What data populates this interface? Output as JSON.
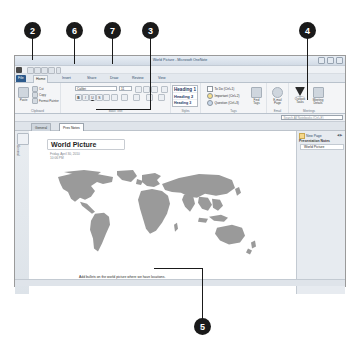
{
  "window": {
    "title": "World Picture - Microsoft OneNote",
    "controls": [
      "minimize",
      "restore",
      "close"
    ]
  },
  "quick_access": {
    "buttons": [
      "save-icon",
      "undo-icon",
      "dock-icon",
      "full-page-icon",
      "print-icon",
      "customize-icon"
    ]
  },
  "ribbon": {
    "file_tab": "File",
    "tabs": [
      {
        "label": "Home",
        "active": true
      },
      {
        "label": "Insert",
        "active": false
      },
      {
        "label": "Share",
        "active": false
      },
      {
        "label": "Draw",
        "active": false
      },
      {
        "label": "Review",
        "active": false
      },
      {
        "label": "View",
        "active": false
      }
    ],
    "groups": [
      {
        "name": "Clipboard",
        "label": "Clipboard",
        "paste_label": "Paste",
        "items": [
          "Cut",
          "Copy",
          "Format Painter"
        ]
      },
      {
        "name": "Basic Text",
        "label": "Basic Text",
        "font_name": "Calibri",
        "font_size": "11",
        "buttons": [
          "B",
          "I",
          "U",
          "abc",
          "A",
          "highlight",
          "font-color",
          "bullets",
          "numbering",
          "indent",
          "align",
          "styles"
        ]
      },
      {
        "name": "Styles",
        "label": "Styles",
        "styles": [
          "Heading 1",
          "Heading 2",
          "Heading 3"
        ]
      },
      {
        "name": "Tags",
        "label": "Tags",
        "tags": [
          "To Do (Ctrl+1)",
          "Important (Ctrl+2)",
          "Question (Ctrl+3)"
        ],
        "find_tags_label": "Find Tags"
      },
      {
        "name": "Email",
        "label": "Email",
        "email_page_label": "E-mail Page"
      },
      {
        "name": "Meetings",
        "label": "Meetings",
        "outlook_tasks_label": "Outlook Tasks",
        "meeting_details_label": "Meeting Details"
      }
    ]
  },
  "search": {
    "placeholder": "Search All Notebooks (Ctrl+E)"
  },
  "section_tabs": [
    {
      "label": "General",
      "active": false
    },
    {
      "label": "Pres Notes",
      "active": true
    }
  ],
  "navigation": {
    "notebook_label": "General"
  },
  "page": {
    "title": "World Picture",
    "date": "Friday, April 30, 2010",
    "time": "10:06 PM",
    "caption": "Add bullets on the world picture where we have locations."
  },
  "right_pane": {
    "new_page_label": "New Page",
    "section_header": "Presentation Notes",
    "pages": [
      "World Picture"
    ]
  },
  "callouts": [
    {
      "number": "2",
      "x": 24,
      "y": 22
    },
    {
      "number": "6",
      "x": 66,
      "y": 22
    },
    {
      "number": "7",
      "x": 104,
      "y": 22
    },
    {
      "number": "3",
      "x": 142,
      "y": 22
    },
    {
      "number": "4",
      "x": 299,
      "y": 22
    },
    {
      "number": "5",
      "x": 194,
      "y": 327
    }
  ],
  "colors": {
    "callout_bg": "#1a1a1a",
    "callout_text": "#ffffff",
    "file_tab": "#2c5a8c",
    "map_land": "#9a9a9a",
    "title_text": "#31506e"
  }
}
